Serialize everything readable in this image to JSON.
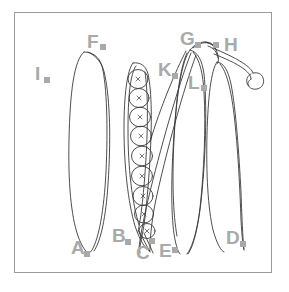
{
  "figure": {
    "frame": {
      "border_color": "#9a9a9a",
      "background": "#ffffff"
    },
    "line_color": "#3a3a3a",
    "label_color": "#a9a9a9",
    "marker_shape": "square"
  },
  "labels": [
    {
      "key": "A",
      "text": "A",
      "x": 71,
      "y": 238,
      "marker_x": 84,
      "marker_y": 251
    },
    {
      "key": "B",
      "text": "B",
      "x": 112,
      "y": 226,
      "marker_x": 125,
      "marker_y": 239
    },
    {
      "key": "C",
      "text": "C",
      "x": 136,
      "y": 243,
      "marker_x": 149,
      "marker_y": 238
    },
    {
      "key": "D",
      "text": "D",
      "x": 226,
      "y": 228,
      "marker_x": 240,
      "marker_y": 241
    },
    {
      "key": "E",
      "text": "E",
      "x": 159,
      "y": 241,
      "marker_x": 172,
      "marker_y": 247
    },
    {
      "key": "F",
      "text": "F",
      "x": 87,
      "y": 32,
      "marker_x": 100,
      "marker_y": 44
    },
    {
      "key": "G",
      "text": "G",
      "x": 180,
      "y": 29,
      "marker_x": 195,
      "marker_y": 42
    },
    {
      "key": "H",
      "text": "H",
      "x": 224,
      "y": 35,
      "marker_x": 213,
      "marker_y": 42
    },
    {
      "key": "I",
      "text": "I",
      "x": 35,
      "y": 64,
      "marker_x": 44,
      "marker_y": 77
    },
    {
      "key": "K",
      "text": "K",
      "x": 158,
      "y": 60,
      "marker_x": 172,
      "marker_y": 73
    },
    {
      "key": "L",
      "text": "L",
      "x": 188,
      "y": 73,
      "marker_x": 201,
      "marker_y": 85
    }
  ],
  "pods": [
    {
      "id": "pod-left-closed",
      "label_top": "F",
      "label_tip": "A",
      "description": "closed elongated pod at left"
    },
    {
      "id": "pod-open-seeds",
      "label_top": "K",
      "label_tip": "C",
      "description": "opened pod showing seeds in a row"
    },
    {
      "id": "pod-center-right",
      "label_top": "G",
      "label_tip": "E",
      "description": "narrow pod converging to a point"
    },
    {
      "id": "pod-far-right",
      "label_top": "H",
      "label_tip": "D",
      "description": "outer pod with curled tendril at top"
    }
  ],
  "seeds": {
    "count": 9,
    "glyph": "×",
    "description": "round seeds each marked with a small cross"
  }
}
